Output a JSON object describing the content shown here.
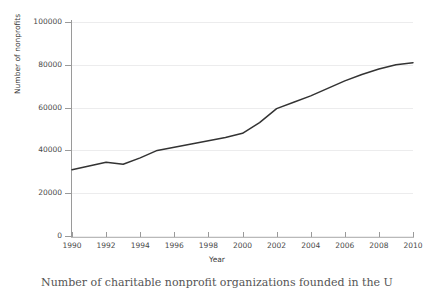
{
  "figure": {
    "caption": "Number of charitable nonprofit organizations founded in the U",
    "background_color": "#ffffff"
  },
  "axes": {
    "ylabel": "Number of nonprofits",
    "xlabel": "Year",
    "y_ticks": [
      "0",
      "20000",
      "40000",
      "60000",
      "80000",
      "100000"
    ],
    "x_ticks": [
      "1990",
      "1992",
      "1994",
      "1996",
      "1998",
      "2000",
      "2002",
      "2004",
      "2006",
      "2008",
      "2010"
    ],
    "grid_color": "#ececed",
    "spine_color": "#9a9a9a",
    "tick_label_color": "#4a4a4a"
  },
  "chart_data": {
    "type": "line",
    "title": "",
    "xlabel": "Year",
    "ylabel": "Number of nonprofits",
    "xlim": [
      1990,
      2010
    ],
    "ylim": [
      0,
      100000
    ],
    "grid": true,
    "grid_axis": "y",
    "legend": false,
    "line_color": "#333333",
    "line_width": 1.5,
    "markers": false,
    "x": [
      1990,
      1991,
      1992,
      1993,
      1994,
      1995,
      1996,
      1997,
      1998,
      1999,
      2000,
      2001,
      2002,
      2003,
      2004,
      2005,
      2006,
      2007,
      2008,
      2009,
      2010
    ],
    "values": [
      31000,
      32700,
      34500,
      33500,
      36500,
      40000,
      41500,
      43000,
      44500,
      46000,
      48000,
      53000,
      59500,
      62500,
      65500,
      69000,
      72500,
      75500,
      78000,
      80000,
      81000
    ],
    "series": [
      {
        "name": "Number of nonprofits",
        "values": [
          31000,
          32700,
          34500,
          33500,
          36500,
          40000,
          41500,
          43000,
          44500,
          46000,
          48000,
          53000,
          59500,
          62500,
          65500,
          69000,
          72500,
          75500,
          78000,
          80000,
          81000
        ]
      }
    ]
  }
}
